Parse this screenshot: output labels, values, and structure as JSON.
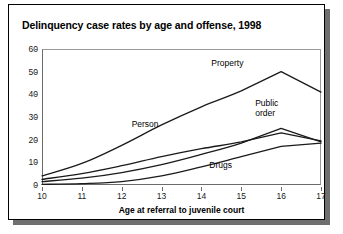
{
  "figure": {
    "title": "Delinquency case rates by age and offense, 1998"
  },
  "chart_data": {
    "type": "line",
    "title": "Delinquency case rates by age and offense, 1998",
    "xlabel": "Age at referral to juvenile court",
    "ylabel": "",
    "xlim": [
      10,
      17
    ],
    "ylim": [
      0,
      60
    ],
    "xticks": [
      "10",
      "11",
      "12",
      "13",
      "14",
      "15",
      "16",
      "17"
    ],
    "yticks": [
      "0",
      "10",
      "20",
      "30",
      "40",
      "50",
      "60"
    ],
    "grid": false,
    "legend": "inline-labels",
    "x": [
      10,
      11,
      12,
      13,
      14,
      15,
      16,
      17
    ],
    "series": [
      {
        "name": "Property",
        "label": "Property",
        "color": "#1a1a1a",
        "values": [
          4.0,
          9.5,
          17.5,
          26.5,
          34.5,
          41.5,
          50.0,
          41.0
        ]
      },
      {
        "name": "Person",
        "label": "Person",
        "color": "#1a1a1a",
        "values": [
          2.5,
          5.0,
          8.5,
          12.5,
          16.0,
          19.0,
          23.0,
          19.5
        ]
      },
      {
        "name": "Public order",
        "label": "Public\norder",
        "label_line1": "Public",
        "label_line2": "order",
        "color": "#1a1a1a",
        "values": [
          1.5,
          3.0,
          5.5,
          9.0,
          13.5,
          18.5,
          25.0,
          19.0
        ]
      },
      {
        "name": "Drugs",
        "label": "Drugs",
        "color": "#1a1a1a",
        "values": [
          0.3,
          0.6,
          1.5,
          4.0,
          8.0,
          12.5,
          17.0,
          18.5
        ]
      }
    ]
  }
}
